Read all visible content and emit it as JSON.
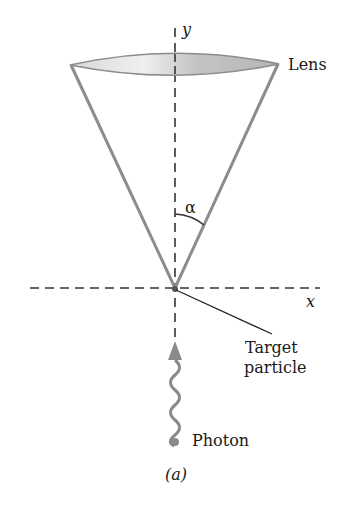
{
  "figure": {
    "caption": "(a)",
    "labels": {
      "y_axis": "y",
      "x_axis": "x",
      "lens": "Lens",
      "angle": "α",
      "target_line1": "Target",
      "target_line2": "particle",
      "photon": "Photon"
    },
    "colors": {
      "cone_lines": "#8c8c8c",
      "lens_fill_light": "#f2f2f2",
      "lens_fill_dark": "#b8b8b8",
      "axis": "#333333",
      "photon": "#8a8a8a",
      "text": "#1a1a1a"
    }
  }
}
